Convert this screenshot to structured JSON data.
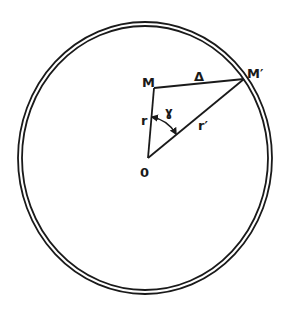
{
  "diagram": {
    "type": "geometry-figure",
    "colors": {
      "ink": "#1a1a1a",
      "background": "#ffffff"
    },
    "points": {
      "O": {
        "label": "0",
        "x": 148,
        "y": 158
      },
      "M": {
        "label": "M",
        "x": 154,
        "y": 88
      },
      "M_prime": {
        "label": "M′",
        "x": 244,
        "y": 79
      }
    },
    "segments": [
      {
        "name": "r",
        "from": "O",
        "to": "M",
        "label": "r"
      },
      {
        "name": "r_prime",
        "from": "O",
        "to": "M_prime",
        "label": "r′"
      },
      {
        "name": "delta",
        "from": "M",
        "to": "M_prime",
        "label": "Δ"
      }
    ],
    "angle": {
      "label": "ɣ",
      "vertex": "O",
      "between": [
        "r",
        "r_prime"
      ],
      "arrows": "both-ends"
    },
    "circle": {
      "style": "double-line",
      "cx": 145,
      "cy": 158,
      "rx": 127,
      "ry": 136
    }
  },
  "labels": {
    "M": "M",
    "M_prime": "M′",
    "O": "0",
    "delta": "Δ",
    "r": "r",
    "r_prime": "r′",
    "gamma": "ɣ"
  }
}
